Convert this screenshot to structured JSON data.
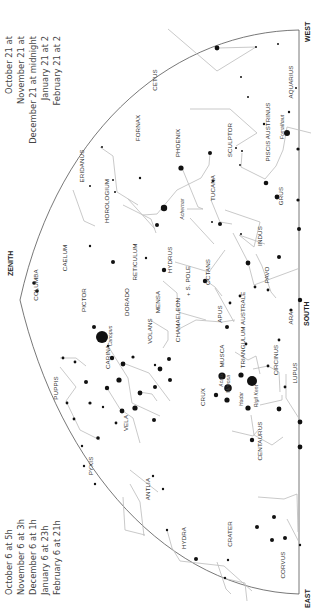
{
  "chart": {
    "directions": {
      "zenith": "ZENITH",
      "south": "SOUTH",
      "east": "EAST",
      "west": "WEST"
    },
    "pole_label": "+ S. POLE",
    "times_left": [
      {
        "date": "October 6",
        "time": "at 5h"
      },
      {
        "date": "November 6",
        "time": "at 3h"
      },
      {
        "date": "December 6",
        "time": "at 1h"
      },
      {
        "date": "January 6",
        "time": "at 23h"
      },
      {
        "date": "February 6",
        "time": "at 21h"
      }
    ],
    "times_right": [
      {
        "date": "October 21",
        "time": "at"
      },
      {
        "date": "November 21",
        "time": "at"
      },
      {
        "date": "December 21",
        "time": "at midnight"
      },
      {
        "date": "January 21",
        "time": "at 2"
      },
      {
        "date": "February 21",
        "time": "at 2"
      }
    ],
    "constellations": [
      {
        "name": "CETUS",
        "x": 157,
        "y": 80
      },
      {
        "name": "AQUARIUS",
        "x": 293,
        "y": 82
      },
      {
        "name": "FORNAX",
        "x": 140,
        "y": 128
      },
      {
        "name": "SCULPTOR",
        "x": 232,
        "y": 140
      },
      {
        "name": "PISCIS AUSTRINUS",
        "x": 270,
        "y": 132
      },
      {
        "name": "PHOENIX",
        "x": 180,
        "y": 143
      },
      {
        "name": "ERIDANUS",
        "x": 84,
        "y": 166
      },
      {
        "name": "GRUS",
        "x": 283,
        "y": 196
      },
      {
        "name": "TUCANA",
        "x": 215,
        "y": 188
      },
      {
        "name": "HOROLOGIUM",
        "x": 109,
        "y": 201
      },
      {
        "name": "INDUS",
        "x": 262,
        "y": 236
      },
      {
        "name": "CAELUM",
        "x": 67,
        "y": 258
      },
      {
        "name": "RETICULUM",
        "x": 137,
        "y": 262
      },
      {
        "name": "HYDRUS",
        "x": 172,
        "y": 260
      },
      {
        "name": "OCTANS",
        "x": 210,
        "y": 272
      },
      {
        "name": "PAVO",
        "x": 269,
        "y": 275
      },
      {
        "name": "COLUMBA",
        "x": 38,
        "y": 285
      },
      {
        "name": "PICTOR",
        "x": 86,
        "y": 300
      },
      {
        "name": "DORADO",
        "x": 129,
        "y": 302
      },
      {
        "name": "MENSA",
        "x": 160,
        "y": 302
      },
      {
        "name": "CHAMAELEON",
        "x": 180,
        "y": 320
      },
      {
        "name": "APUS",
        "x": 222,
        "y": 314
      },
      {
        "name": "ARA",
        "x": 293,
        "y": 318
      },
      {
        "name": "VOLANS",
        "x": 152,
        "y": 331
      },
      {
        "name": "TRIANGULUM AUSTRALE",
        "x": 245,
        "y": 330
      },
      {
        "name": "CARINA",
        "x": 110,
        "y": 357
      },
      {
        "name": "PUPPIS",
        "x": 58,
        "y": 388
      },
      {
        "name": "MUSCA",
        "x": 224,
        "y": 356
      },
      {
        "name": "CIRCINUS",
        "x": 278,
        "y": 360
      },
      {
        "name": "CRUX",
        "x": 205,
        "y": 397
      },
      {
        "name": "VELA",
        "x": 128,
        "y": 423
      },
      {
        "name": "LUPUS",
        "x": 297,
        "y": 373
      },
      {
        "name": "CENTAURUS",
        "x": 262,
        "y": 441
      },
      {
        "name": "PYXIS",
        "x": 93,
        "y": 466
      },
      {
        "name": "ANTLIA",
        "x": 150,
        "y": 489
      },
      {
        "name": "HYDRA",
        "x": 186,
        "y": 538
      },
      {
        "name": "CRATER",
        "x": 232,
        "y": 534
      },
      {
        "name": "CORVUS",
        "x": 285,
        "y": 565
      }
    ],
    "named_stars": [
      {
        "name": "Fomalhaut",
        "x": 284,
        "y": 127
      },
      {
        "name": "Achernar",
        "x": 184,
        "y": 209
      },
      {
        "name": "Canopus",
        "x": 112,
        "y": 336
      },
      {
        "name": "Acrux",
        "x": 223,
        "y": 380
      },
      {
        "name": "Mimosa",
        "x": 230,
        "y": 384
      },
      {
        "name": "Hadar",
        "x": 243,
        "y": 399
      },
      {
        "name": "Rigil Kent",
        "x": 258,
        "y": 396
      }
    ]
  }
}
